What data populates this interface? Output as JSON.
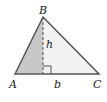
{
  "diagram": {
    "vertices": {
      "A": {
        "label": "A",
        "x": 15,
        "y": 74
      },
      "B": {
        "label": "B",
        "x": 43,
        "y": 17
      },
      "C": {
        "label": "C",
        "x": 99,
        "y": 74
      }
    },
    "altitude": {
      "label": "h",
      "foot_x": 43,
      "foot_y": 74,
      "style": "dashed"
    },
    "base": {
      "label": "b"
    },
    "right_angle_marker": {
      "size": 8
    },
    "colors": {
      "stroke": "#555555",
      "shaded_region": "#c8c8c8",
      "unshaded_region": "#f2f2f2",
      "label": "#222222"
    }
  }
}
